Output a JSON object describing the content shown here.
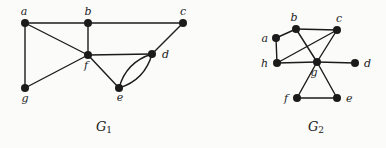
{
  "page": {
    "background": "#fbfbfa",
    "ink": "#1b1b1b"
  },
  "graphs": [
    {
      "id": "g1",
      "caption": {
        "main": "G",
        "sub": "1",
        "x": 104,
        "y": 131
      },
      "vertices": [
        {
          "id": "a",
          "x": 25,
          "y": 23,
          "lx": 24,
          "ly": 15,
          "ta": "middle"
        },
        {
          "id": "b",
          "x": 88,
          "y": 23,
          "lx": 88,
          "ly": 15,
          "ta": "middle"
        },
        {
          "id": "c",
          "x": 183,
          "y": 23,
          "lx": 183,
          "ly": 15,
          "ta": "middle"
        },
        {
          "id": "f",
          "x": 88,
          "y": 55,
          "lx": 86,
          "ly": 69,
          "ta": "middle"
        },
        {
          "id": "d",
          "x": 152,
          "y": 54,
          "lx": 162,
          "ly": 58,
          "ta": "start"
        },
        {
          "id": "e",
          "x": 119,
          "y": 88,
          "lx": 120,
          "ly": 101,
          "ta": "middle"
        },
        {
          "id": "g",
          "x": 25,
          "y": 88,
          "lx": 25,
          "ly": 102,
          "ta": "middle"
        }
      ],
      "edges": [
        {
          "from": "a",
          "to": "b"
        },
        {
          "from": "b",
          "to": "c"
        },
        {
          "from": "a",
          "to": "g"
        },
        {
          "from": "a",
          "to": "f"
        },
        {
          "from": "b",
          "to": "f"
        },
        {
          "from": "g",
          "to": "f"
        },
        {
          "from": "f",
          "to": "d"
        },
        {
          "from": "f",
          "to": "e"
        },
        {
          "from": "c",
          "to": "d"
        },
        {
          "from": "e",
          "to": "d",
          "bend": 13
        },
        {
          "from": "e",
          "to": "d",
          "bend": -13
        }
      ]
    },
    {
      "id": "g2",
      "caption": {
        "main": "G",
        "sub": "2",
        "x": 316,
        "y": 131
      },
      "vertices": [
        {
          "id": "a",
          "x": 276,
          "y": 38,
          "lx": 268,
          "ly": 42,
          "ta": "end"
        },
        {
          "id": "b",
          "x": 296,
          "y": 29,
          "lx": 294,
          "ly": 21,
          "ta": "middle"
        },
        {
          "id": "c",
          "x": 337,
          "y": 30,
          "lx": 339,
          "ly": 22,
          "ta": "middle"
        },
        {
          "id": "h",
          "x": 277,
          "y": 63,
          "lx": 268,
          "ly": 67,
          "ta": "end"
        },
        {
          "id": "g",
          "x": 317,
          "y": 62,
          "lx": 314,
          "ly": 76,
          "ta": "middle"
        },
        {
          "id": "d",
          "x": 355,
          "y": 63,
          "lx": 364,
          "ly": 67,
          "ta": "start"
        },
        {
          "id": "f",
          "x": 297,
          "y": 98,
          "lx": 288,
          "ly": 102,
          "ta": "end"
        },
        {
          "id": "e",
          "x": 337,
          "y": 98,
          "lx": 346,
          "ly": 102,
          "ta": "start"
        }
      ],
      "edges": [
        {
          "from": "a",
          "to": "b"
        },
        {
          "from": "b",
          "to": "c"
        },
        {
          "from": "a",
          "to": "h"
        },
        {
          "from": "h",
          "to": "g"
        },
        {
          "from": "b",
          "to": "g"
        },
        {
          "from": "c",
          "to": "h"
        },
        {
          "from": "c",
          "to": "g"
        },
        {
          "from": "g",
          "to": "d"
        },
        {
          "from": "g",
          "to": "f"
        },
        {
          "from": "g",
          "to": "e"
        },
        {
          "from": "f",
          "to": "e"
        }
      ]
    }
  ]
}
